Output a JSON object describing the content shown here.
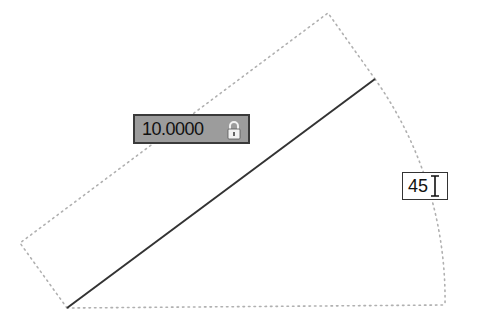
{
  "drawing": {
    "line": {
      "x1": 67,
      "y1": 308,
      "x2": 375,
      "y2": 79,
      "color": "#333333"
    },
    "dotted_outline_color": "#b0b0b0",
    "outline_points": [
      [
        67,
        308
      ],
      [
        20,
        243
      ],
      [
        328,
        13
      ],
      [
        375,
        79
      ]
    ],
    "arc": {
      "start": [
        375,
        79
      ],
      "end": [
        445,
        305
      ],
      "baseline_start": [
        67,
        308
      ]
    }
  },
  "length_input": {
    "value": "10.0000",
    "locked": true,
    "lock_icon": "lock-icon",
    "fill_color": "#9c9c9c"
  },
  "angle_input": {
    "value": "45",
    "cursor_icon": "text-cursor-icon"
  }
}
